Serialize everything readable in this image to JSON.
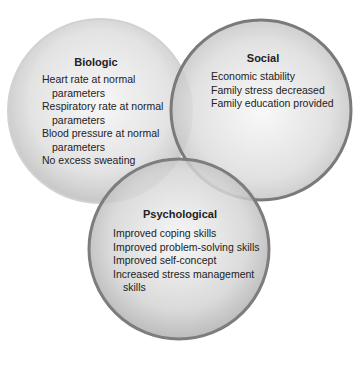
{
  "circles": {
    "biologic": {
      "title": "Biologic",
      "items": [
        "Heart rate at normal",
        "parameters",
        "Respiratory rate at normal",
        "parameters",
        "Blood pressure at normal",
        "parameters",
        "No excess sweating"
      ]
    },
    "social": {
      "title": "Social",
      "items": [
        "Economic stability",
        "Family stress decreased",
        "Family education provided"
      ]
    },
    "psychological": {
      "title": "Psychological",
      "items": [
        "Improved coping skills",
        "Improved problem-solving skills",
        "Improved self-concept",
        "Increased stress management",
        "skills"
      ]
    }
  },
  "colors": {
    "circle_fill_light": "#f4f4f4",
    "circle_fill_dark": "#b8b8b8",
    "biologic_stroke": "#c9c9c9",
    "social_stroke": "#7a7a7a",
    "psychological_stroke": "#7d7d7d",
    "text": "#222222"
  }
}
